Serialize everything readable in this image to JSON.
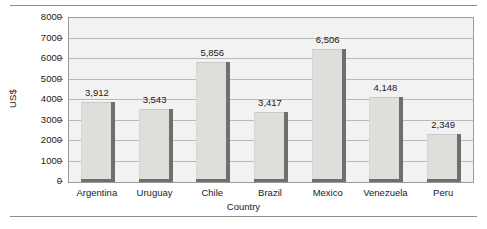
{
  "chart_data": {
    "type": "bar",
    "title": "",
    "xlabel": "Country",
    "ylabel": "US$",
    "categories": [
      "Argentina",
      "Uruguay",
      "Chile",
      "Brazil",
      "Mexico",
      "Venezuela",
      "Peru"
    ],
    "values": [
      3912,
      3543,
      5856,
      3417,
      6506,
      4148,
      2349
    ],
    "value_labels": [
      "3,912",
      "3,543",
      "5,856",
      "3,417",
      "6,506",
      "4,148",
      "2,349"
    ],
    "ylim": [
      0,
      8000
    ],
    "ytick_values": [
      0,
      1000,
      2000,
      3000,
      4000,
      5000,
      6000,
      7000,
      8000
    ],
    "ytick_labels": [
      "0",
      "1000",
      "2000",
      "3000",
      "4000",
      "5000",
      "6000",
      "7000",
      "8000"
    ],
    "grid": true,
    "legend": false,
    "legend_position": "none",
    "colors": {
      "bar_fill": "#dededb",
      "bar_shadow": "#6f6f6f",
      "plot_background": "#f2f2f2",
      "gridline": "#b9b9b9",
      "frame": "#9a9a9a",
      "text": "#1a1a1a",
      "rule": "#8d8d8d"
    }
  }
}
